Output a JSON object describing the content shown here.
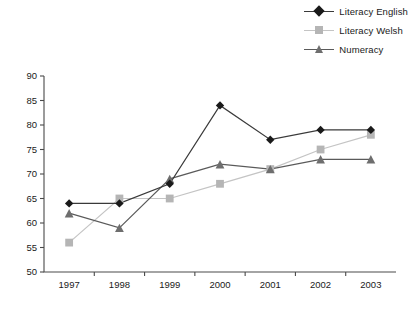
{
  "chart_data": {
    "type": "line",
    "title": "",
    "xlabel": "",
    "ylabel": "",
    "categories": [
      "1997",
      "1998",
      "1999",
      "2000",
      "2001",
      "2002",
      "2003"
    ],
    "ylim": [
      50,
      90
    ],
    "yticks": [
      50,
      55,
      60,
      65,
      70,
      75,
      80,
      85,
      90
    ],
    "grid": false,
    "legend_position": "top-right",
    "series": [
      {
        "name": "Literacy English",
        "marker": "diamond",
        "color": "#1a1a1a",
        "line_color": "#3a3a3a",
        "values": [
          64,
          64,
          68,
          84,
          77,
          79,
          79
        ]
      },
      {
        "name": "Literacy Welsh",
        "marker": "square",
        "color": "#b5b5b5",
        "line_color": "#c4c4c4",
        "values": [
          56,
          65,
          65,
          68,
          71,
          75,
          78
        ]
      },
      {
        "name": "Numeracy",
        "marker": "triangle",
        "color": "#6e6e6e",
        "line_color": "#5a5a5a",
        "values": [
          62,
          59,
          69,
          72,
          71,
          73,
          73
        ]
      }
    ]
  },
  "legend": {
    "items": [
      {
        "label": "Literacy English"
      },
      {
        "label": "Literacy Welsh"
      },
      {
        "label": "Numeracy"
      }
    ]
  },
  "axes": {
    "y_tick_labels": [
      "90",
      "85",
      "80",
      "75",
      "70",
      "65",
      "60",
      "55",
      "50"
    ],
    "x_tick_labels": [
      "1997",
      "1998",
      "1999",
      "2000",
      "2001",
      "2002",
      "2003"
    ]
  }
}
